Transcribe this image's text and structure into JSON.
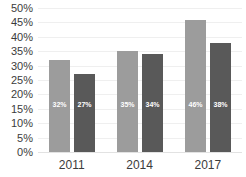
{
  "chart_data": {
    "type": "bar",
    "title": "",
    "subtitle": "",
    "xlabel": "",
    "ylabel": "",
    "categories": [
      "2011",
      "2014",
      "2017"
    ],
    "series": [
      {
        "name": "Series 1",
        "color": "#9c9c9c",
        "values": [
          32,
          35,
          46
        ],
        "labels": [
          "32%",
          "35%",
          "46%"
        ]
      },
      {
        "name": "Series 2",
        "color": "#595959",
        "values": [
          27,
          34,
          38
        ],
        "labels": [
          "27%",
          "34%",
          "38%"
        ]
      }
    ],
    "ylim": [
      0,
      50
    ],
    "y_ticks": [
      50,
      45,
      40,
      35,
      30,
      25,
      20,
      15,
      10,
      5,
      0
    ],
    "y_tick_labels": [
      "50%",
      "45%",
      "40%",
      "35%",
      "30%",
      "25%",
      "20%",
      "15%",
      "10%",
      "5%",
      "0%"
    ],
    "value_suffix": "%",
    "grid": true,
    "grid_axis": "y",
    "grid_color": "#efefef",
    "legend": false,
    "legend_position": "none",
    "background_color": "#ffffff",
    "text_color": "#3b3b3b",
    "data_label_color": "#ffffff"
  }
}
